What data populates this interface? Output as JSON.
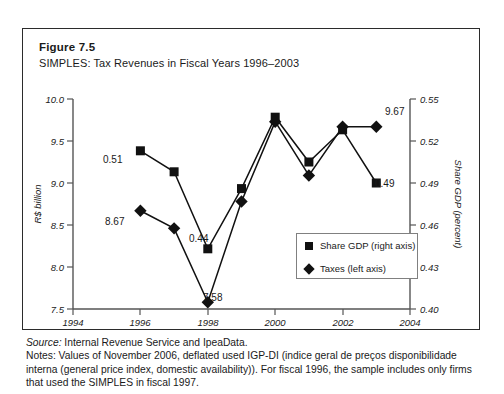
{
  "figure": {
    "label": "Figure 7.5",
    "subtitle": "SIMPLES: Tax Revenues in Fiscal Years 1996–2003"
  },
  "notes": {
    "source_prefix": "Source:",
    "source_text": " Internal Revenue Service and IpeaData.",
    "notes_text": "Notes: Values of November 2006, deflated used IGP-DI (indice geral de preços disponibilidade interna (general price index, domestic availability)). For fiscal 1996, the sample includes only firms that used the SIMPLES in fiscal 1997."
  },
  "legend": {
    "items": [
      {
        "label": "Share GDP (right axis)",
        "marker": "square-marker-icon"
      },
      {
        "label": "Taxes (left axis)",
        "marker": "diamond-marker-icon"
      }
    ]
  },
  "chart_data": {
    "type": "line",
    "title": "SIMPLES: Tax Revenues in Fiscal Years 1996–2003",
    "xlabel": "",
    "ylabel": "R$ billion",
    "y2label": "Share GDP (percent)",
    "x": [
      1996,
      1997,
      1998,
      1999,
      2000,
      2001,
      2002,
      2003
    ],
    "xlim": [
      1994,
      2004
    ],
    "xticks": [
      1994,
      1996,
      1998,
      2000,
      2002,
      2004
    ],
    "xtick_labels": [
      "1994",
      "1996",
      "1998",
      "2000",
      "2002",
      "2004"
    ],
    "ylim": [
      7.5,
      10.0
    ],
    "yticks": [
      7.5,
      8.0,
      8.5,
      9.0,
      9.5,
      10.0
    ],
    "ytick_labels": [
      "7.5",
      "8.0",
      "8.5",
      "9.0",
      "9.5",
      "10.0"
    ],
    "y2lim": [
      0.4,
      0.55
    ],
    "y2ticks": [
      0.4,
      0.43,
      0.46,
      0.49,
      0.52,
      0.55
    ],
    "y2tick_labels": [
      "0.40",
      "0.43",
      "0.46",
      "0.49",
      "0.52",
      "0.55"
    ],
    "grid": false,
    "legend_position": "inside-lower-right",
    "series": [
      {
        "name": "Taxes (left axis)",
        "axis": "left",
        "marker": "diamond",
        "values": [
          8.67,
          8.46,
          7.58,
          8.78,
          9.73,
          9.09,
          9.67,
          9.67
        ]
      },
      {
        "name": "Share GDP (right axis)",
        "axis": "right",
        "marker": "square",
        "values": [
          0.513,
          0.498,
          0.443,
          0.486,
          0.537,
          0.505,
          0.528,
          0.49
        ]
      }
    ],
    "annotations": [
      {
        "text": "0.51",
        "series": "Share GDP (right axis)",
        "x": 1996
      },
      {
        "text": "8.67",
        "series": "Taxes (left axis)",
        "x": 1996
      },
      {
        "text": "0.44",
        "series": "Share GDP (right axis)",
        "x": 1998
      },
      {
        "text": "7.58",
        "series": "Taxes (left axis)",
        "x": 1998
      },
      {
        "text": "9.67",
        "series": "Taxes (left axis)",
        "x": 2003
      },
      {
        "text": "0.49",
        "series": "Share GDP (right axis)",
        "x": 2003
      }
    ]
  }
}
